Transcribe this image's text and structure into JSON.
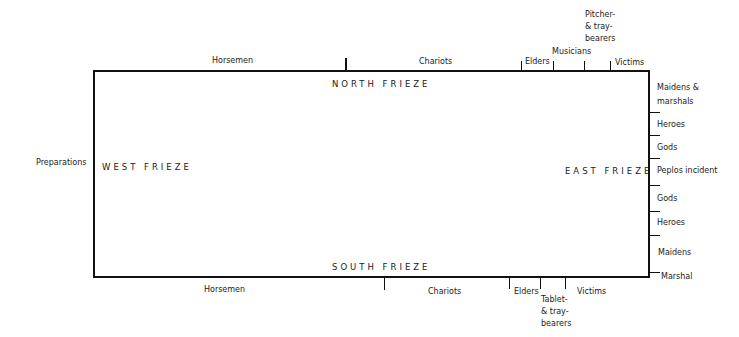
{
  "diagram": {
    "friezes": {
      "north": "NORTH FRIEZE",
      "south": "SOUTH FRIEZE",
      "west": "WEST FRIEZE",
      "east": "EAST FRIEZE"
    },
    "west_outside": "Preparations",
    "north_sections": [
      "Horsemen",
      "Chariots",
      "Elders",
      "Musicians",
      "Pitcher-\n& tray-\nbearers",
      "Victims"
    ],
    "south_sections": [
      "Horsemen",
      "Chariots",
      "Elders",
      "Tablet-\n& tray-\nbearers",
      "Victims"
    ],
    "east_sections": [
      "Maidens &\nmarshals",
      "Heroes",
      "Gods",
      "Peplos  incident",
      "Gods",
      "Heroes",
      "Maidens",
      "Marshal"
    ]
  }
}
